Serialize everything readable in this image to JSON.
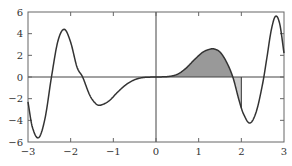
{
  "chart_data": {
    "type": "line",
    "title": "",
    "xlabel": "",
    "ylabel": "",
    "xlim": [
      -3,
      3
    ],
    "ylim": [
      -6,
      6
    ],
    "grid": false,
    "legend": null,
    "x_ticks": [
      -3,
      -2,
      -1,
      0,
      1,
      2,
      3
    ],
    "x_tick_labels": [
      "−3",
      "−2",
      "−1",
      "0",
      "1",
      "2",
      "3"
    ],
    "y_ticks": [
      -6,
      -4,
      -2,
      0,
      2,
      4,
      6
    ],
    "y_tick_labels": [
      "−6",
      "−4",
      "−2",
      "0",
      "2",
      "4",
      "6"
    ],
    "zero_axes": true,
    "series": [
      {
        "name": "f(x)",
        "color": "#333333",
        "x": [
          -3.0,
          -2.9,
          -2.75,
          -2.6,
          -2.45,
          -2.3,
          -2.15,
          -2.0,
          -1.85,
          -1.72,
          -1.55,
          -1.4,
          -1.3,
          -1.1,
          -0.9,
          -0.7,
          -0.5,
          -0.3,
          0.0,
          0.3,
          0.5,
          0.7,
          0.9,
          1.1,
          1.25,
          1.35,
          1.5,
          1.65,
          1.8,
          1.95,
          2.05,
          2.2,
          2.35,
          2.5,
          2.6,
          2.7,
          2.8,
          2.9,
          3.0
        ],
        "y": [
          -2.3,
          -4.6,
          -5.6,
          -3.8,
          0.0,
          3.3,
          4.4,
          3.2,
          0.9,
          0.0,
          -1.7,
          -2.5,
          -2.6,
          -2.2,
          -1.4,
          -0.7,
          -0.25,
          -0.05,
          0.0,
          0.05,
          0.25,
          0.8,
          1.6,
          2.3,
          2.55,
          2.6,
          2.3,
          1.4,
          0.0,
          -2.2,
          -3.4,
          -4.25,
          -3.2,
          -0.6,
          1.8,
          4.3,
          5.6,
          4.9,
          2.2
        ]
      }
    ],
    "shaded_regions": [
      {
        "from_x": 0,
        "to_x": 1.8,
        "sign": "positive",
        "fill": "#999999",
        "description": "area under curve above x-axis"
      },
      {
        "from_x": 1.8,
        "to_x": 2.0,
        "sign": "negative",
        "fill": "#cccccc",
        "description": "area between curve and x-axis below axis"
      }
    ],
    "annotations": []
  }
}
